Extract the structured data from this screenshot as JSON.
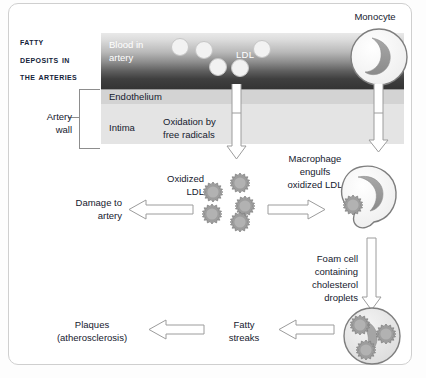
{
  "figure": {
    "title_lines": [
      "Fatty",
      "Deposits in",
      "the Arteries"
    ],
    "accent_dark": "#343434",
    "accent_light": "#e4e4e4",
    "cell_fill": "#f2f2f2",
    "particle_fill": "#9a9a9a",
    "text_color": "#15202e"
  },
  "vessel": {
    "blood_label": "Blood in\nartery",
    "blood_label_line1": "Blood in",
    "blood_label_line2": "artery",
    "ldl_label": "LDL",
    "endothelium_label": "Endothelium",
    "intima_label": "Intima",
    "artery_wall_label_line1": "Artery",
    "artery_wall_label_line2": "wall",
    "ldl_particles": [
      {
        "x": 179,
        "y": 46,
        "r": 8
      },
      {
        "x": 203,
        "y": 49,
        "r": 8
      },
      {
        "x": 253,
        "y": 48,
        "r": 8
      },
      {
        "x": 217,
        "y": 66,
        "r": 8
      },
      {
        "x": 239,
        "y": 67,
        "r": 8
      }
    ]
  },
  "steps": {
    "monocyte_label": "Monocyte",
    "oxidation_label_line1": "Oxidation by",
    "oxidation_label_line2": "free radicals",
    "oxidized_ldl_label_line1": "Oxidized",
    "oxidized_ldl_label_line2": "LDL",
    "macrophage_label_line1": "Macrophage",
    "macrophage_label_line2": "engulfs",
    "macrophage_label_line3": "oxidized LDL",
    "damage_label_line1": "Damage to",
    "damage_label_line2": "artery",
    "foam_cell_label_line1": "Foam cell",
    "foam_cell_label_line2": "containing",
    "foam_cell_label_line3": "cholesterol",
    "foam_cell_label_line4": "droplets",
    "fatty_streaks_label_line1": "Fatty",
    "fatty_streaks_label_line2": "streaks",
    "plaques_label_line1": "Plaques",
    "plaques_label_line2": "(atherosclerosis)"
  },
  "oxidized_ldl_cluster": [
    {
      "x": 211,
      "y": 206,
      "r": 8
    },
    {
      "x": 236,
      "y": 184,
      "r": 9
    },
    {
      "x": 240,
      "y": 208,
      "r": 8
    },
    {
      "x": 211,
      "y": 188,
      "r": 7
    },
    {
      "x": 236,
      "y": 184,
      "r": 8
    }
  ],
  "flow_arrows": [
    {
      "name": "monocyte-to-macrophage",
      "direction": "down"
    },
    {
      "name": "oxidation-to-oxidized-ldl",
      "direction": "down"
    },
    {
      "name": "oxidized-ldl-to-macrophage",
      "direction": "right"
    },
    {
      "name": "oxidized-ldl-to-damage",
      "direction": "left"
    },
    {
      "name": "macrophage-to-foam-cell",
      "direction": "down"
    },
    {
      "name": "foam-cell-to-fatty-streaks",
      "direction": "left"
    },
    {
      "name": "fatty-streaks-to-plaques",
      "direction": "left"
    }
  ]
}
